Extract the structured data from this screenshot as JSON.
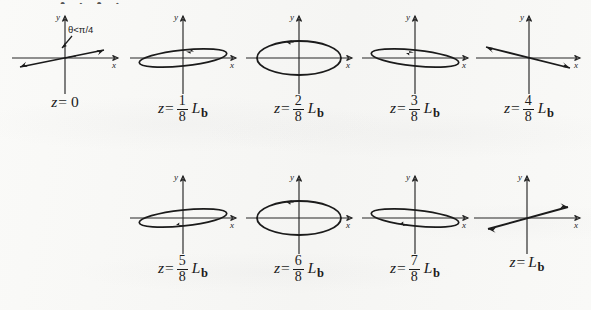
{
  "figure": {
    "top_cut_text": "• ∙ • ∙",
    "axis_labels": {
      "x": "x",
      "y": "y"
    },
    "annotation": {
      "theta": "θ<π/4"
    },
    "ink_color": "#1b1b1b",
    "paper_color": "#f7f7f5"
  },
  "panels": [
    {
      "id": "panel-z-0",
      "state": "linear",
      "label": {
        "lhs": "z",
        "eq": "=",
        "whole": "0",
        "num": "",
        "den": "",
        "L": "",
        "sub": ""
      },
      "label_plain": "z= 0",
      "shape": {
        "type": "line",
        "slope_deg": 18,
        "arrow": "double",
        "note": "linear polarization at angle theta less than pi/4"
      },
      "has_theta_annotation": true
    },
    {
      "id": "panel-z-1-8",
      "state": "elliptical",
      "label": {
        "lhs": "z",
        "eq": "=",
        "whole": "",
        "num": "1",
        "den": "8",
        "L": "L",
        "sub": "b"
      },
      "label_plain": "z= 1/8 Lb",
      "shape": {
        "type": "ellipse",
        "rx": 44,
        "ry": 8,
        "tilt_deg": -6,
        "sense": "counterclockwise",
        "arrow_at": "top-right",
        "arrow_dir": "right"
      },
      "has_theta_annotation": false
    },
    {
      "id": "panel-z-2-8",
      "state": "circular",
      "label": {
        "lhs": "z",
        "eq": "=",
        "whole": "",
        "num": "2",
        "den": "8",
        "L": "L",
        "sub": "b"
      },
      "label_plain": "z= 2/8 Lb",
      "shape": {
        "type": "ellipse",
        "rx": 42,
        "ry": 17,
        "tilt_deg": 0,
        "sense": "counterclockwise",
        "arrow_at": "top-left",
        "arrow_dir": "left"
      },
      "has_theta_annotation": false
    },
    {
      "id": "panel-z-3-8",
      "state": "elliptical",
      "label": {
        "lhs": "z",
        "eq": "=",
        "whole": "",
        "num": "3",
        "den": "8",
        "L": "L",
        "sub": "b"
      },
      "label_plain": "z= 3/8 Lb",
      "shape": {
        "type": "ellipse",
        "rx": 44,
        "ry": 8,
        "tilt_deg": 6,
        "sense": "counterclockwise",
        "arrow_at": "top-middle",
        "arrow_dir": "left"
      },
      "has_theta_annotation": false
    },
    {
      "id": "panel-z-4-8",
      "state": "linear",
      "label": {
        "lhs": "z",
        "eq": "=",
        "whole": "",
        "num": "4",
        "den": "8",
        "L": "L",
        "sub": "b"
      },
      "label_plain": "z= 4/8 Lb",
      "shape": {
        "type": "line",
        "slope_deg": -14,
        "arrow": "double",
        "note": "linear polarization reflected about x axis"
      },
      "has_theta_annotation": false
    },
    {
      "id": "panel-z-5-8",
      "state": "elliptical",
      "label": {
        "lhs": "z",
        "eq": "=",
        "whole": "",
        "num": "5",
        "den": "8",
        "L": "L",
        "sub": "b"
      },
      "label_plain": "z= 5/8 Lb",
      "shape": {
        "type": "ellipse",
        "rx": 44,
        "ry": 8,
        "tilt_deg": -6,
        "sense": "clockwise",
        "arrow_at": "bottom-middle",
        "arrow_dir": "left"
      },
      "has_theta_annotation": false
    },
    {
      "id": "panel-z-6-8",
      "state": "circular",
      "label": {
        "lhs": "z",
        "eq": "=",
        "whole": "",
        "num": "6",
        "den": "8",
        "L": "L",
        "sub": "b"
      },
      "label_plain": "z= 6/8 Lb",
      "shape": {
        "type": "ellipse",
        "rx": 42,
        "ry": 17,
        "tilt_deg": 0,
        "sense": "clockwise",
        "arrow_at": "top-left",
        "arrow_dir": "left"
      },
      "has_theta_annotation": false
    },
    {
      "id": "panel-z-7-8",
      "state": "elliptical",
      "label": {
        "lhs": "z",
        "eq": "=",
        "whole": "",
        "num": "7",
        "den": "8",
        "L": "L",
        "sub": "b"
      },
      "label_plain": "z= 7/8 Lb",
      "shape": {
        "type": "ellipse",
        "rx": 44,
        "ry": 8,
        "tilt_deg": 6,
        "sense": "clockwise",
        "arrow_at": "bottom-middle",
        "arrow_dir": "left"
      },
      "has_theta_annotation": false
    },
    {
      "id": "panel-z-Lb",
      "state": "linear",
      "label": {
        "lhs": "z",
        "eq": "=",
        "whole": "",
        "num": "",
        "den": "",
        "L": "L",
        "sub": "b"
      },
      "label_plain": "z=Lb",
      "shape": {
        "type": "line",
        "slope_deg": 14,
        "arrow": "double",
        "note": "linear polarization restored"
      },
      "has_theta_annotation": false
    }
  ]
}
